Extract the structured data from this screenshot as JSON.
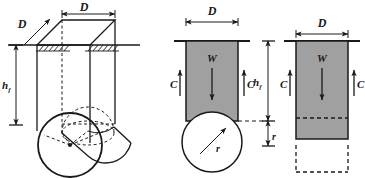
{
  "figure": {
    "background_color": "#ffffff",
    "line_color": "#1a1a1a",
    "fill_gray": "#a0a0a0",
    "fill_white": "#ffffff"
  },
  "panels": [
    {
      "id": "perspective-view",
      "name": "three-dimensional perspective of buried pipe prism",
      "labels": {
        "width_top": "D",
        "depth_oblique": "D",
        "height": "h",
        "height_subscript": "f"
      }
    },
    {
      "id": "free-body-circular",
      "name": "free-body diagram with circular pipe cross-section",
      "labels": {
        "width_top": "D",
        "weight": "W",
        "cohesion_left": "C",
        "cohesion_right": "C",
        "radius": "r",
        "height": "h",
        "height_subscript": "f",
        "radius_dim": "r"
      }
    },
    {
      "id": "free-body-rectangular",
      "name": "equivalent rectangular prism free-body diagram",
      "labels": {
        "width_top": "D",
        "weight": "W",
        "cohesion_left": "C",
        "cohesion_right": "C"
      }
    }
  ],
  "symbols": {
    "D": "D",
    "W": "W",
    "C": "C",
    "r": "r",
    "h": "h",
    "f": "f"
  }
}
